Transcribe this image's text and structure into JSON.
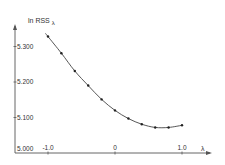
{
  "chart_data": {
    "type": "line",
    "title": "",
    "ylabel": "ln RSS",
    "ylabel_subscript": "λ",
    "xlabel": "λ",
    "x": [
      -1.0,
      -0.8,
      -0.6,
      -0.4,
      -0.2,
      0.0,
      0.2,
      0.4,
      0.6,
      0.8,
      1.0
    ],
    "series": [
      {
        "name": "ln RSS_λ",
        "values": [
          5.328,
          5.281,
          5.231,
          5.19,
          5.151,
          5.12,
          5.097,
          5.081,
          5.072,
          5.072,
          5.078
        ]
      }
    ],
    "xlim": [
      -1.0,
      1.4
    ],
    "ylim": [
      5.0,
      5.37
    ],
    "x_ticks": [
      {
        "value": -1.0,
        "label": "-1.0"
      },
      {
        "value": 0.0,
        "label": "0"
      },
      {
        "value": 1.0,
        "label": "1.0"
      }
    ],
    "y_ticks": [
      {
        "value": 5.0,
        "label": "5.000"
      },
      {
        "value": 5.1,
        "label": "5.100"
      },
      {
        "value": 5.2,
        "label": "5.200"
      },
      {
        "value": 5.3,
        "label": "5.300"
      }
    ],
    "grid": false,
    "legend": "none",
    "colors": {
      "line": "#444444",
      "marker": "#222222",
      "axis": "#555555",
      "text": "#333333"
    }
  }
}
